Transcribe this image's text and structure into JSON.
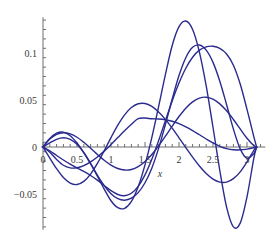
{
  "chart_data": {
    "type": "line",
    "title": "",
    "subtitle": "",
    "xlabel": "x",
    "ylabel": "",
    "xlim": [
      0,
      3.25
    ],
    "ylim": [
      -0.09,
      0.138
    ],
    "grid": false,
    "legend": null,
    "legend_position": "none",
    "line_color": "#2b2b8f",
    "axis_color": "#6e6e6e",
    "x_ticks": [
      0,
      0.5,
      1,
      1.5,
      2,
      2.5,
      3
    ],
    "x_tick_labels": [
      "0",
      "0.5",
      "1",
      "1.5",
      "2",
      "2.5",
      "3"
    ],
    "x_minor_tick_step": 0.1,
    "y_ticks": [
      -0.05,
      0,
      0.05,
      0.1
    ],
    "y_tick_labels": [
      "-0.05",
      "0",
      "0.05",
      "0.1"
    ],
    "y_minor_tick_step": 0.01,
    "annotations": [],
    "series": [
      {
        "name": "curve-1",
        "x": [
          0,
          0.1,
          0.2,
          0.3,
          0.4,
          0.5,
          0.6,
          0.7,
          0.8,
          0.9,
          1.0,
          1.1,
          1.2,
          1.3,
          1.4,
          1.5,
          1.6,
          1.7,
          1.8,
          1.9,
          2.0,
          2.1,
          2.2,
          2.3,
          2.4,
          2.5,
          2.6,
          2.7,
          2.8,
          2.9,
          3.0,
          3.1,
          3.1416
        ],
        "values": [
          0,
          -0.0055,
          -0.0132,
          -0.0194,
          -0.0222,
          -0.0221,
          -0.0198,
          -0.0158,
          -0.0106,
          -0.0044,
          0.0026,
          0.01,
          0.0174,
          0.0243,
          0.0301,
          0.0308,
          0.03,
          0.0298,
          0.029,
          0.0274,
          0.0248,
          0.0215,
          0.0175,
          0.013,
          0.0085,
          0.0043,
          0.0007,
          -0.0018,
          -0.003,
          -0.003,
          -0.0022,
          -0.0008,
          0
        ]
      },
      {
        "name": "curve-2",
        "x": [
          0,
          0.1,
          0.2,
          0.3,
          0.4,
          0.5,
          0.6,
          0.7,
          0.8,
          0.9,
          1.0,
          1.1,
          1.2,
          1.3,
          1.4,
          1.5,
          1.6,
          1.7,
          1.8,
          1.9,
          2.0,
          2.1,
          2.2,
          2.3,
          2.4,
          2.5,
          2.6,
          2.7,
          2.8,
          2.9,
          3.0,
          3.1,
          3.1416
        ],
        "values": [
          0,
          0.0084,
          0.0135,
          0.0152,
          0.014,
          0.0104,
          0.005,
          -0.0013,
          -0.0079,
          -0.0141,
          -0.0193,
          -0.0229,
          -0.0245,
          -0.0239,
          -0.0209,
          -0.0155,
          -0.008,
          0.0012,
          0.0115,
          0.0222,
          0.0324,
          0.0413,
          0.048,
          0.052,
          0.053,
          0.0509,
          0.0459,
          0.0385,
          0.0293,
          0.0192,
          0.0093,
          0.0015,
          0
        ]
      },
      {
        "name": "curve-3",
        "x": [
          0,
          0.1,
          0.2,
          0.3,
          0.4,
          0.5,
          0.6,
          0.7,
          0.8,
          0.9,
          1.0,
          1.1,
          1.2,
          1.3,
          1.4,
          1.5,
          1.6,
          1.7,
          1.8,
          1.9,
          2.0,
          2.1,
          2.2,
          2.3,
          2.4,
          2.5,
          2.6,
          2.7,
          2.8,
          2.9,
          3.0,
          3.1,
          3.1416
        ],
        "values": [
          0,
          -0.0118,
          -0.0231,
          -0.0325,
          -0.0384,
          -0.0399,
          -0.0366,
          -0.0288,
          -0.0175,
          -0.0041,
          0.01,
          0.0232,
          0.0342,
          0.042,
          0.046,
          0.0463,
          0.0432,
          0.0373,
          0.0294,
          0.02,
          0.0098,
          -0.0006,
          -0.0108,
          -0.0202,
          -0.0282,
          -0.0341,
          -0.0373,
          -0.0373,
          -0.0337,
          -0.0264,
          -0.0158,
          -0.0035,
          0
        ]
      },
      {
        "name": "curve-4",
        "x": [
          0,
          0.1,
          0.2,
          0.3,
          0.4,
          0.5,
          0.6,
          0.7,
          0.8,
          0.9,
          1.0,
          1.1,
          1.2,
          1.3,
          1.4,
          1.5,
          1.6,
          1.7,
          1.8,
          1.9,
          2.0,
          2.1,
          2.2,
          2.3,
          2.4,
          2.5,
          2.6,
          2.7,
          2.8,
          2.9,
          3.0,
          3.1,
          3.1416
        ],
        "values": [
          0,
          -0.004,
          -0.009,
          -0.0138,
          -0.0182,
          -0.0222,
          -0.026,
          -0.0303,
          -0.0353,
          -0.041,
          -0.0465,
          -0.0505,
          -0.0518,
          -0.0492,
          -0.0419,
          -0.0297,
          -0.0131,
          0.0067,
          0.028,
          0.049,
          0.068,
          0.0838,
          0.0955,
          0.103,
          0.1066,
          0.1072,
          0.105,
          0.099,
          0.087,
          0.067,
          0.04,
          0.011,
          0
        ]
      },
      {
        "name": "curve-5",
        "x": [
          0,
          0.1,
          0.2,
          0.3,
          0.4,
          0.5,
          0.6,
          0.7,
          0.8,
          0.9,
          1.0,
          1.1,
          1.2,
          1.3,
          1.4,
          1.5,
          1.6,
          1.7,
          1.8,
          1.9,
          2.0,
          2.1,
          2.2,
          2.3,
          2.4,
          2.5,
          2.6,
          2.7,
          2.8,
          2.9,
          3.0,
          3.1,
          3.1416
        ],
        "values": [
          0,
          0.0043,
          0.0082,
          0.0098,
          0.0082,
          0.003,
          -0.0058,
          -0.0175,
          -0.031,
          -0.0448,
          -0.0572,
          -0.0646,
          -0.0652,
          -0.0578,
          -0.0422,
          -0.019,
          0.01,
          0.043,
          0.077,
          0.108,
          0.128,
          0.134,
          0.125,
          0.101,
          0.065,
          0.021,
          -0.025,
          -0.064,
          -0.085,
          -0.081,
          -0.053,
          -0.012,
          0
        ]
      },
      {
        "name": "curve-6",
        "x": [
          0,
          0.1,
          0.2,
          0.3,
          0.4,
          0.5,
          0.6,
          0.7,
          0.8,
          0.9,
          1.0,
          1.1,
          1.2,
          1.3,
          1.4,
          1.5,
          1.6,
          1.7,
          1.8,
          1.9,
          2.0,
          2.1,
          2.2,
          2.3,
          2.4,
          2.5,
          2.6,
          2.7,
          2.8,
          2.9,
          3.0,
          3.1,
          3.1416
        ],
        "values": [
          0,
          0.009,
          0.0148,
          0.0158,
          0.012,
          0.0042,
          -0.0062,
          -0.018,
          -0.03,
          -0.041,
          -0.0497,
          -0.055,
          -0.0566,
          -0.0545,
          -0.0485,
          -0.038,
          -0.0225,
          -0.0015,
          0.024,
          0.051,
          0.076,
          0.095,
          0.106,
          0.1085,
          0.103,
          0.09,
          0.07,
          0.045,
          0.019,
          -0.002,
          -0.012,
          -0.007,
          0
        ]
      }
    ]
  }
}
